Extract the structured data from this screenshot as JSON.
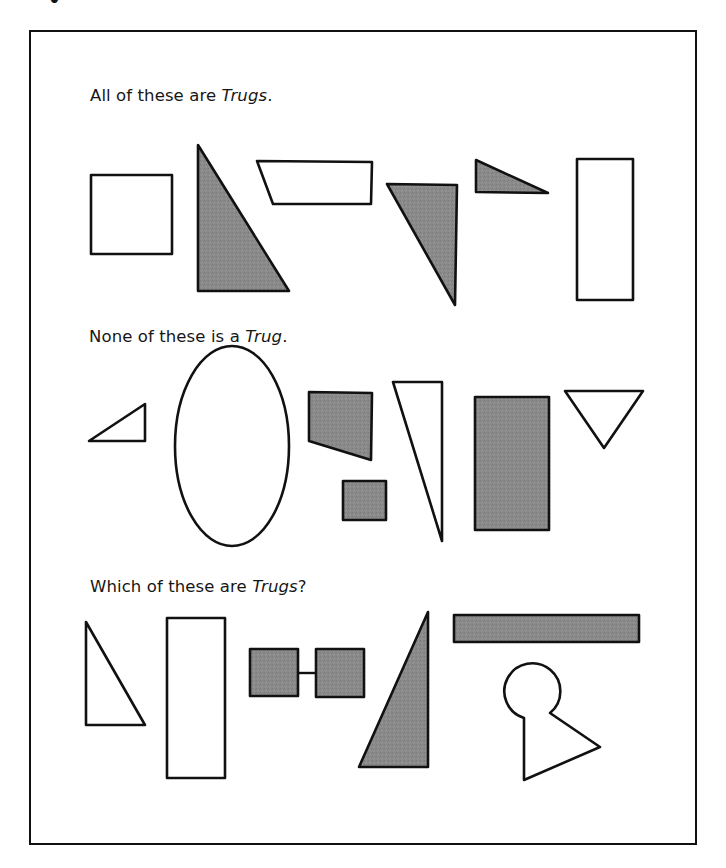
{
  "page": {
    "cutoff_heading": "•"
  },
  "colors": {
    "shape_fill_grey": "#8a8a8a",
    "outline": "#111111",
    "background": "#ffffff"
  },
  "sections": [
    {
      "id": "trugs",
      "caption_prefix": "All of these are ",
      "caption_emph": "Trugs",
      "caption_suffix": ".",
      "shapes": [
        {
          "name": "square",
          "fill": "white"
        },
        {
          "name": "right-triangle",
          "fill": "grey"
        },
        {
          "name": "parallelogram",
          "fill": "white"
        },
        {
          "name": "inverted-right-triangle",
          "fill": "grey"
        },
        {
          "name": "small-right-triangle",
          "fill": "grey"
        },
        {
          "name": "tall-rectangle",
          "fill": "white"
        }
      ]
    },
    {
      "id": "non-trugs",
      "caption_prefix": "None of these is a ",
      "caption_emph": "Trug",
      "caption_suffix": ".",
      "shapes": [
        {
          "name": "small-triangle",
          "fill": "white"
        },
        {
          "name": "ellipse",
          "fill": "white"
        },
        {
          "name": "quadrilateral",
          "fill": "grey"
        },
        {
          "name": "small-square",
          "fill": "grey"
        },
        {
          "name": "thin-triangle",
          "fill": "white"
        },
        {
          "name": "rectangle",
          "fill": "grey"
        },
        {
          "name": "inverted-triangle",
          "fill": "white"
        }
      ]
    },
    {
      "id": "question",
      "caption_prefix": "Which of these are ",
      "caption_emph": "Trugs",
      "caption_suffix": "?",
      "shapes": [
        {
          "name": "right-triangle",
          "fill": "white"
        },
        {
          "name": "tall-rectangle",
          "fill": "white"
        },
        {
          "name": "linked-squares",
          "fill": "grey"
        },
        {
          "name": "right-triangle",
          "fill": "grey"
        },
        {
          "name": "long-bar",
          "fill": "grey"
        },
        {
          "name": "keyhole",
          "fill": "white"
        }
      ]
    }
  ]
}
